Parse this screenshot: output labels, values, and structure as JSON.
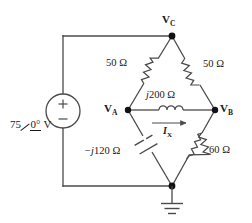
{
  "figure": {
    "name": "ac-bridge-circuit-diagram",
    "background": "#ffffff",
    "ink": "#1a1a1a"
  },
  "source": {
    "magnitude": "75",
    "angle": "0°",
    "unit": "V",
    "plus_sign": "+",
    "minus_sign": "−",
    "type": "independent-voltage-source"
  },
  "nodes": [
    {
      "id": "VC",
      "letter": "V",
      "subscript": "C",
      "x": 172,
      "y": 36
    },
    {
      "id": "VA",
      "letter": "V",
      "subscript": "A",
      "x": 128,
      "y": 110
    },
    {
      "id": "VB",
      "letter": "V",
      "subscript": "B",
      "x": 215,
      "y": 110
    },
    {
      "id": "GND",
      "letter": "",
      "subscript": "",
      "x": 172,
      "y": 186
    }
  ],
  "components": [
    {
      "id": "R1",
      "label": "50 Ω",
      "type": "resistor",
      "between": "VA-VC"
    },
    {
      "id": "R2",
      "label": "50 Ω",
      "type": "resistor",
      "between": "VC-VB"
    },
    {
      "id": "L1",
      "label": "j200 Ω",
      "label_italic_prefix": "j",
      "label_rest": "200 Ω",
      "type": "inductor",
      "between": "VA-VB"
    },
    {
      "id": "C1",
      "label": "−j120 Ω",
      "label_italic_prefix": "−j",
      "label_rest": "120 Ω",
      "type": "capacitor",
      "between": "VA-GND"
    },
    {
      "id": "R3",
      "label": "60 Ω",
      "type": "resistor",
      "between": "VB-GND"
    }
  ],
  "current": {
    "symbol": "I",
    "subscript": "X",
    "direction": "right",
    "branch": "VA-VB"
  },
  "ground": {
    "label": "earth-ground",
    "bars": 3
  }
}
